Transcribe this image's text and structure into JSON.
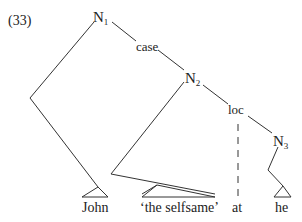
{
  "example_number": "(33)",
  "nodes": {
    "n1": {
      "label": "N",
      "sub": "1"
    },
    "n2": {
      "label": "N",
      "sub": "2"
    },
    "n3": {
      "label": "N",
      "sub": "3"
    }
  },
  "edge_labels": {
    "case": "case",
    "loc": "loc"
  },
  "leaves": [
    "John",
    "‘the selfsame’",
    "at",
    "he"
  ],
  "colors": {
    "line": "#333333",
    "text": "#222222",
    "background": "#ffffff"
  }
}
